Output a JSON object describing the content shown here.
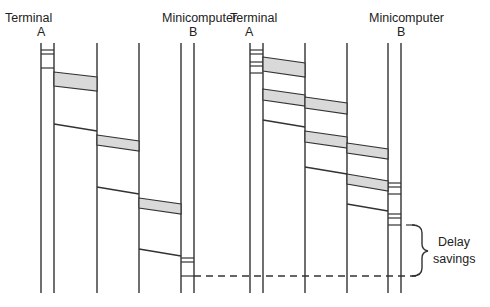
{
  "diagram": {
    "left": {
      "source_label": "Terminal",
      "source_id": "A",
      "dest_label": "Minicomputer",
      "dest_id": "B",
      "hops": 3,
      "packets_per_hop": 1
    },
    "right": {
      "source_label": "Terminal",
      "source_id": "A",
      "dest_label": "Minicomputer",
      "dest_id": "B",
      "hops": 3,
      "packets_per_hop": 2
    },
    "annotation": {
      "line1": "Delay",
      "line2": "savings"
    },
    "colors": {
      "line": "#333333",
      "packet_fill": "#d9d9d9",
      "text": "#222222"
    }
  }
}
